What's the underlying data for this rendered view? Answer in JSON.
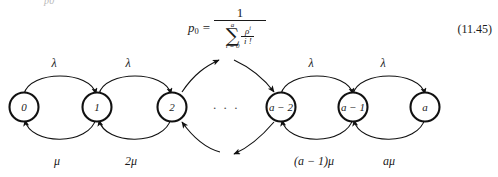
{
  "page": {
    "remnant_text": "p0",
    "background_color": "#ffffff",
    "ink_color": "#1a1a1a"
  },
  "equation": {
    "label": "(11.45)",
    "lhs_symbol": "p",
    "lhs_subscript": "0",
    "relation": "=",
    "numerator": "1",
    "denominator": {
      "sum_sign": "∑",
      "sum_upper_limit": "a",
      "sum_lower_limit": "i = 0",
      "term_numerator": "ρ",
      "term_numerator_exponent": "i",
      "term_denominator": "i !"
    },
    "plain_text": "p0 = 1 / sum(i=0..a) rho^i / i!"
  },
  "diagram": {
    "type": "markov-chain",
    "ellipsis": "· · ·",
    "nodes": [
      {
        "id": "s0",
        "label": "0",
        "cx": 24
      },
      {
        "id": "s1",
        "label": "1",
        "cx": 97
      },
      {
        "id": "s2",
        "label": "2",
        "cx": 172
      },
      {
        "id": "sa2",
        "label": "a − 2",
        "cx": 281
      },
      {
        "id": "sa1",
        "label": "a − 1",
        "cx": 353
      },
      {
        "id": "sa",
        "label": "a",
        "cx": 425
      }
    ],
    "forward_rates": [
      {
        "from": "s0",
        "to": "s1",
        "label": "λ",
        "x": 54
      },
      {
        "from": "s1",
        "to": "s2",
        "label": "λ",
        "x": 128
      },
      {
        "from": "sa2",
        "to": "sa1",
        "label": "λ",
        "x": 311
      },
      {
        "from": "sa1",
        "to": "sa",
        "label": "λ",
        "x": 383
      }
    ],
    "backward_rates": [
      {
        "from": "s1",
        "to": "s0",
        "label": "μ",
        "x": 57
      },
      {
        "from": "s2",
        "to": "s1",
        "label": "2μ",
        "x": 131
      },
      {
        "from": "sa1",
        "to": "sa2",
        "label": "(a − 1)μ",
        "x": 314
      },
      {
        "from": "sa",
        "to": "sa1",
        "label": "aμ",
        "x": 389
      }
    ]
  }
}
